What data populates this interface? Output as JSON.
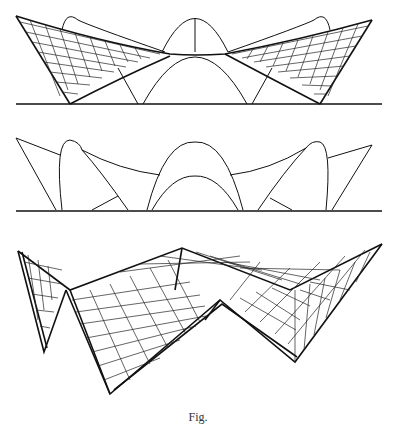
{
  "figure": {
    "panels": [
      {
        "id": "top",
        "description": "Elevation of hyperbolic paraboloid shell roof with ruling lines",
        "ground_y": 103
      },
      {
        "id": "middle",
        "description": "Elevation outline of intersecting shell arches",
        "ground_y": 210
      },
      {
        "id": "bottom",
        "description": "Perspective wireframe of hypar shell structure"
      }
    ],
    "caption": "Fig."
  },
  "colors": {
    "line": "#111111",
    "background": "#ffffff"
  }
}
